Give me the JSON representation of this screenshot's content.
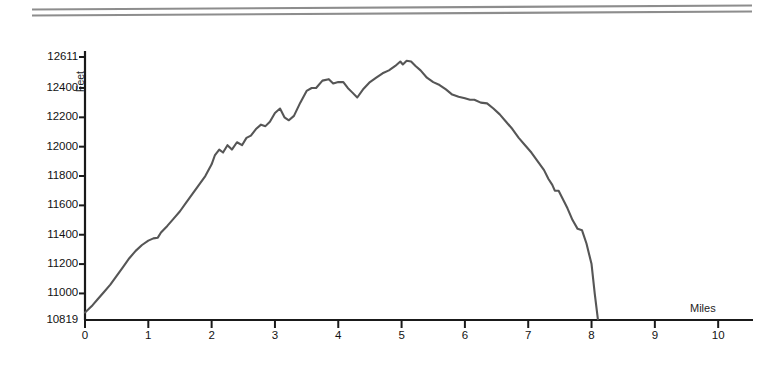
{
  "page": {
    "background_color": "#ffffff",
    "rule_color": "#8d8d8d"
  },
  "ornament": {
    "name": "double-horizontal-rule",
    "line_count": 2
  },
  "chart_data": {
    "type": "line",
    "title": "",
    "subtitle": "",
    "xlabel": "Miles",
    "ylabel": "Feet",
    "grid": false,
    "legend": null,
    "line_color": "#565656",
    "axis_color": "#1a1a1a",
    "xlim": [
      0,
      10.55
    ],
    "ylim": [
      10819,
      12611
    ],
    "xticks": [
      0,
      1,
      2,
      3,
      4,
      5,
      6,
      7,
      8,
      9,
      10
    ],
    "xtick_labels": [
      "0",
      "1",
      "2",
      "3",
      "4",
      "5",
      "6",
      "7",
      "8",
      "9",
      "10"
    ],
    "yticks": [
      10819,
      11000,
      11200,
      11400,
      11600,
      11800,
      12000,
      12200,
      12400,
      12611
    ],
    "ytick_labels": [
      "10819",
      "11000",
      "11200",
      "11400",
      "11600",
      "11800",
      "12000",
      "12200",
      "12400",
      "12611"
    ],
    "x": [
      0.0,
      0.05,
      0.12,
      0.2,
      0.3,
      0.4,
      0.5,
      0.6,
      0.7,
      0.8,
      0.9,
      1.0,
      1.08,
      1.15,
      1.2,
      1.3,
      1.4,
      1.5,
      1.6,
      1.7,
      1.8,
      1.9,
      2.0,
      2.05,
      2.12,
      2.18,
      2.25,
      2.32,
      2.4,
      2.48,
      2.55,
      2.62,
      2.7,
      2.78,
      2.85,
      2.92,
      3.0,
      3.08,
      3.15,
      3.22,
      3.3,
      3.4,
      3.5,
      3.58,
      3.65,
      3.75,
      3.85,
      3.92,
      4.0,
      4.08,
      4.15,
      4.22,
      4.3,
      4.4,
      4.5,
      4.6,
      4.7,
      4.8,
      4.9,
      4.98,
      5.02,
      5.08,
      5.15,
      5.22,
      5.3,
      5.4,
      5.5,
      5.6,
      5.7,
      5.8,
      5.9,
      6.0,
      6.08,
      6.15,
      6.25,
      6.35,
      6.45,
      6.55,
      6.65,
      6.75,
      6.85,
      6.95,
      7.05,
      7.15,
      7.25,
      7.32,
      7.38,
      7.42,
      7.48,
      7.55,
      7.62,
      7.7,
      7.78,
      7.85,
      7.92,
      8.0,
      8.05,
      8.1
    ],
    "y": [
      10870,
      10890,
      10920,
      10960,
      11010,
      11060,
      11120,
      11180,
      11240,
      11290,
      11330,
      11360,
      11375,
      11380,
      11415,
      11460,
      11510,
      11560,
      11620,
      11680,
      11740,
      11800,
      11880,
      11940,
      11980,
      11960,
      12010,
      11980,
      12030,
      12010,
      12060,
      12075,
      12120,
      12150,
      12140,
      12170,
      12230,
      12260,
      12200,
      12180,
      12210,
      12300,
      12380,
      12400,
      12400,
      12450,
      12460,
      12430,
      12440,
      12440,
      12400,
      12370,
      12335,
      12395,
      12440,
      12470,
      12500,
      12520,
      12550,
      12580,
      12560,
      12585,
      12580,
      12550,
      12520,
      12470,
      12440,
      12420,
      12390,
      12355,
      12340,
      12330,
      12320,
      12320,
      12300,
      12295,
      12260,
      12220,
      12170,
      12120,
      12060,
      12010,
      11960,
      11900,
      11840,
      11780,
      11740,
      11700,
      11700,
      11640,
      11580,
      11500,
      11440,
      11430,
      11340,
      11200,
      11000,
      10825
    ]
  }
}
